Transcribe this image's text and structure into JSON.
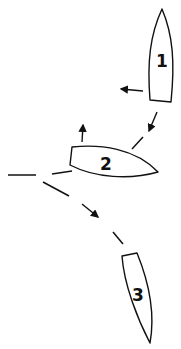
{
  "diagram": {
    "type": "sailing-boat-positions",
    "boats": [
      {
        "id": "boat-1",
        "label": "1",
        "heading": "up"
      },
      {
        "id": "boat-2",
        "label": "2",
        "heading": "right"
      },
      {
        "id": "boat-3",
        "label": "3",
        "heading": "down"
      }
    ],
    "arrows": [
      {
        "id": "boat-1-wind-arrow",
        "direction": "left"
      },
      {
        "id": "boat-1-course-arrow",
        "direction": "down-left"
      },
      {
        "id": "boat-2-wind-arrow",
        "direction": "up"
      },
      {
        "id": "path-arrow",
        "direction": "down-right"
      }
    ],
    "colors": {
      "stroke": "#111111",
      "background": "#ffffff"
    }
  }
}
